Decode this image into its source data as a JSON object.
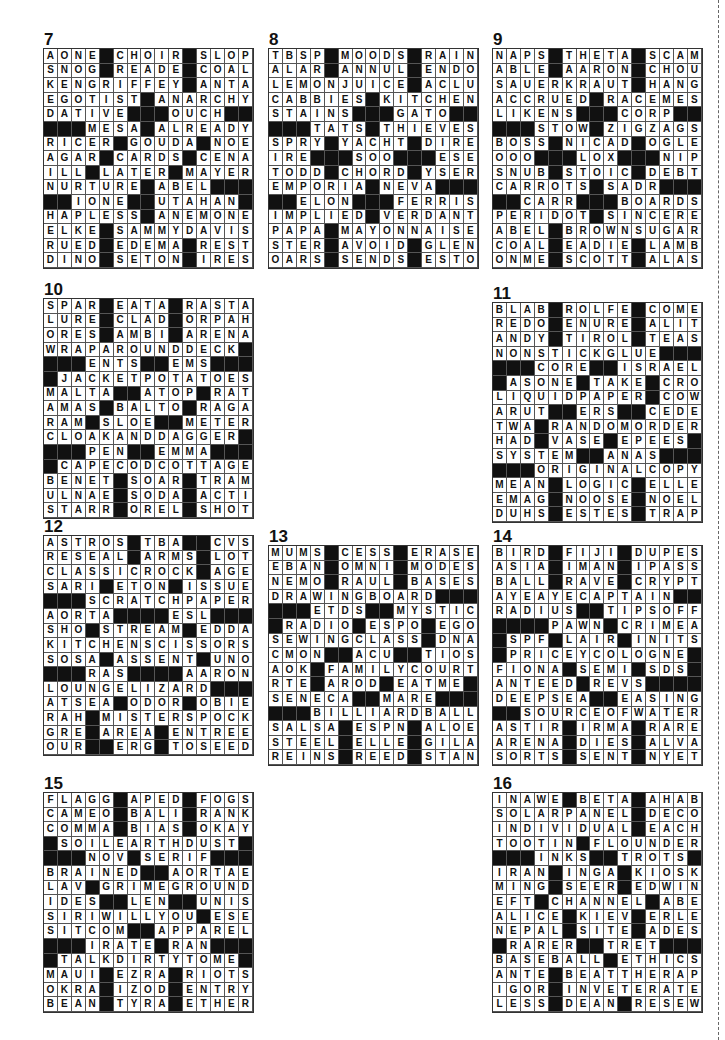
{
  "page": {
    "cut_line": true,
    "puzzles": [
      {
        "number": "7",
        "x": 43,
        "y": 48,
        "rows": [
          "AONE#CHOIR#SLOP",
          "SNOG#READE#COAL",
          "KENGRIFFEY#ANTA",
          "EGOTIST#ANARCHY",
          "DATIVE###OUCH##",
          "###MESA#ALREADY",
          "RICER#GOUDA#NOE",
          "AGAR#CARDS#CENA",
          "ILL#LATER#MAYER",
          "NURTURE#ABEL###",
          "##IONE##UTAHAN",
          "HAPLESS#ANEMONE",
          "ELKE#SAMMYDAVIS",
          "RUED#EDEMA#REST",
          "DINO#SETON#IRES"
        ]
      },
      {
        "number": "8",
        "x": 268,
        "y": 48,
        "rows": [
          "TBSP#MOODS#RAIN",
          "ALAR#ANNUL#ENDO",
          "LEMONJUICE#ACLU",
          "CABBIES#KITCHEN",
          "STAINS###GATO##",
          "###TATS#THIEVES",
          "SPRY#YACHT#DIRE",
          "IRE###SOO###ESE",
          "TODD#CHORD#YSER",
          "EMPORIA#NEVA###",
          "##ELON###FERRIS",
          "IMPLIED#VERDANT",
          "PAPA#MAYONNAISE",
          "STER#AVOID#GLEN",
          "OARS#SENDS#ESTO"
        ]
      },
      {
        "number": "9",
        "x": 492,
        "y": 48,
        "rows": [
          "NAPS#THETA#SCAM",
          "ABLE#AARON#CHOU",
          "SAUERKRAUT#HANG",
          "ACCRUED#RACEMES",
          "LIKENS###CORP##",
          "###STOW#ZIGZAGS",
          "BOSS#NICAD#OGLE",
          "OOO###LOX###NIP",
          "SNUB#STOIC#DEBT",
          "CARROTS#SADR###",
          "##CARR###BOARDS",
          "PERIDOT#SINCERE",
          "ABEL#BROWNSUGAR",
          "COAL#EADIE#LAMB",
          "ONME#SCOTT#ALAS"
        ]
      },
      {
        "number": "10",
        "x": 43,
        "y": 298,
        "rows": [
          "SPAR#EATA#RASTA",
          "LURE#CLAD#ORPAH",
          "ORES#AMBI#ARENA",
          "WRAPAROUNDDECK#",
          "###ENTS##EMS###",
          "#JACKETPOTATOES",
          "MALTA##ATOP#RAT",
          "AMAS#BALTO#RAGA",
          "RAM#SLOE##METER",
          "CLOAKANDDAGGER#",
          "###PEN##EMMA###",
          "#CAPECODCOTTAGE",
          "BENET#SOAR#TRAM",
          "ULNAE#SODA#ACTI",
          "STARR#OREL#SHOT"
        ]
      },
      {
        "number": "11",
        "x": 492,
        "y": 302,
        "rows": [
          "BLAB#ROLFE#COME",
          "REDO#ENURE#ALIT",
          "ANDY#TIROL#TEAS",
          "NONSTICKGLUE###",
          "###CORE##ISRAEL",
          "#ASONE#TAKE#CRO",
          "LIQUIDPAPER#COW",
          "ARUT##ERS##CEDE",
          "TWA#RANDOMORDER",
          "HAD#VASE#EPEES#",
          "SYSTEM##ANAS###",
          "###ORIGINALCOPY",
          "MEAN#LOGIC#ELLE",
          "EMAG#NOOSE#NOEL",
          "DUHS#ESTES#TRAP"
        ]
      },
      {
        "number": "12",
        "x": 43,
        "y": 535,
        "rows": [
          "ASTROS#TBA##CVS",
          "RESEAL#ARMS#LOT",
          "CLASSICROCK#AGE",
          "SARI#ETON#ISSUE",
          "###SCRATCHPAPER",
          "AORTA####ESL###",
          "SHO#STREAM#EDDA",
          "KITCHENSCISSORS",
          "SOSA#ASSENT#UNO",
          "###RAS####AARON",
          "LOUNGELIZARD###",
          "ATSEA#ODOR#OBIE",
          "RAH#MISTERSPOCK",
          "GRE#AREA#ENTREE",
          "OUR##ERG#TOSEED"
        ]
      },
      {
        "number": "13",
        "x": 268,
        "y": 545,
        "rows": [
          "MUMS#CESS#ERASE",
          "EBAN#OMNI#MODES",
          "NEMO#RAUL#BASES",
          "DRAWINGBOARD###",
          "###ETDS##MYSTIC",
          "#RADIO#ESPO#EGO",
          "SEWINGCLASS#DNA",
          "CMON##ACU##TIOS",
          "AOK#FAMILYCOURT",
          "RTE#AROD#EATME#",
          "SENECA##MARE###",
          "###BILLIARDBALL",
          "SALSA#ESPN#ALOE",
          "STEEL#ELLE#GILA",
          "REINS#REED#STAN"
        ]
      },
      {
        "number": "14",
        "x": 492,
        "y": 545,
        "rows": [
          "BIRD#FIJI#DUPES",
          "ASIA#IMAN#IPASS",
          "BALL#RAVE#CRYPT",
          "AYEAYECAPTAIN##",
          "RADIUS##TIPSOFF",
          "####PAWN#CRIMEA",
          "#SPF#LAIR#INITS",
          "#PRICEYCOLOGNE#",
          "FIONA#SEMI#SDS#",
          "ANTEED#REVS####",
          "DEEPSEA##EASING",
          "##SOURCEOFWATER",
          "ASTIR#IRMA#RARE",
          "ARENA#DIES#ALVA",
          "SORTS#SENT#NYET"
        ]
      },
      {
        "number": "15",
        "x": 43,
        "y": 792,
        "rows": [
          "FLAGG#APED#FOGS",
          "CAMEO#BALI#RANK",
          "COMMA#BIAS#OKAY",
          "#SOILEARTHDUST#",
          "###NOV#SERIF###",
          "BRAINED##AORTAE",
          "LAV#GRIMEGROUND",
          "IDES##LEN##UNIS",
          "SIRIWILLYOU#ESE",
          "SITCOM##APPAREL",
          "###IRATE#RAN###",
          "#TALKDIRTYTOME#",
          "MAUI#EZRA#RIOTS",
          "OKRA#IZOD#ENTRY",
          "BEAN#TYRA#ETHER"
        ]
      },
      {
        "number": "16",
        "x": 492,
        "y": 792,
        "rows": [
          "INAWE#BETA#AHAB",
          "SOLARPANEL#DECO",
          "INDIVIDUAL#EACH",
          "TOOTIN#FLOUNDER",
          "###INKS##TROTS#",
          "IRAN#INGA#KIOSK",
          "MING#SEER#EDWIN",
          "EFT#CHANNEL#ABE",
          "ALICE#KIEV#ERLE",
          "NEPAL#SITE#ADES",
          "#RARER##TRET###",
          "BASEBALL#ETHICS",
          "ANTE#BEATTHERAP",
          "IGOR#INVETERATE",
          "LESS#DEAN#RESEW"
        ]
      }
    ]
  }
}
